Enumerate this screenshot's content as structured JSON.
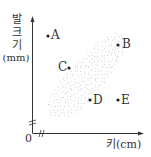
{
  "chart_data": {
    "type": "scatter",
    "title": "",
    "xlabel": "키(cm)",
    "ylabel_lines": [
      "발",
      "크",
      "기",
      "(mm)"
    ],
    "origin_label": "0",
    "axis_breaks": true,
    "region": {
      "description": "shaded dotted band showing positive correlation between height and foot size",
      "trend": "positive"
    },
    "points": [
      {
        "label": "A",
        "x": 48,
        "y": 36,
        "label_side": "right"
      },
      {
        "label": "B",
        "x": 118,
        "y": 45,
        "label_side": "right"
      },
      {
        "label": "C",
        "x": 69,
        "y": 68,
        "label_side": "left"
      },
      {
        "label": "D",
        "x": 90,
        "y": 100,
        "label_side": "right"
      },
      {
        "label": "E",
        "x": 118,
        "y": 100,
        "label_side": "right"
      }
    ],
    "colors": {
      "axis": "#333333",
      "dots": "#9a9a9a",
      "point": "#222222"
    }
  },
  "labels": {
    "y1": "발",
    "y2": "크",
    "y3": "기",
    "y4": "(mm)",
    "x": "키(cm)",
    "origin": "0",
    "A": "A",
    "B": "B",
    "C": "C",
    "D": "D",
    "E": "E"
  }
}
